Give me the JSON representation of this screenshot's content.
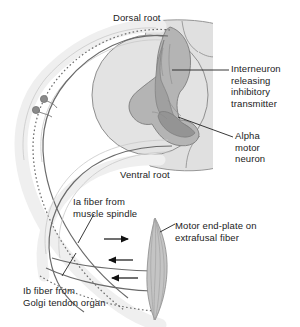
{
  "figure": {
    "labels": {
      "dorsal_root": "Dorsal root",
      "ventral_root": "Ventral root",
      "interneuron": "Interneuron\nreleasing\ninhibitory\ntransmitter",
      "alpha_motor_neuron": "Alpha\nmotor\nneuron",
      "ia_fiber": "Ia fiber from\nmuscle spindle",
      "ib_fiber": "Ib fiber from\nGolgi tendon organ",
      "motor_end_plate": "Motor end-plate on\nextrafusal fiber"
    },
    "colors": {
      "white_matter": "#e3e3e3",
      "gray_matter": "#b8b8b8",
      "dark_gray_matter": "#9a9a9a",
      "nerve_sheath": "#efefef",
      "nerve_line": "#6e6e6e",
      "muscle_fill": "#c9c9c9",
      "text": "#1b1b1b",
      "leader_line": "#222222",
      "background": "#ffffff"
    },
    "elements": {
      "dorsal_root_ganglion_cells": 2,
      "arrows": [
        {
          "name": "efferent-motor-arrow",
          "direction": "right"
        },
        {
          "name": "afferent-ia-arrow",
          "direction": "left"
        },
        {
          "name": "afferent-ib-arrow",
          "direction": "left"
        }
      ],
      "fiber_styles": {
        "ia_fiber": "solid",
        "ib_fiber": "dotted",
        "motor_fiber": "solid"
      }
    }
  }
}
